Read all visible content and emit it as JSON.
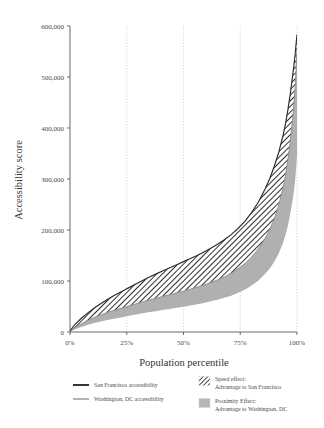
{
  "chart_data": {
    "type": "area",
    "title": "",
    "xlabel": "Population percentile",
    "ylabel": "Accessibility score",
    "xlim": [
      0,
      100
    ],
    "ylim": [
      0,
      600000
    ],
    "grid": true,
    "xticks": [
      0,
      25,
      50,
      75,
      100
    ],
    "xticklabels": [
      "0%",
      "25%",
      "50%",
      "75%",
      "100%"
    ],
    "yticks": [
      0,
      100000,
      200000,
      300000,
      400000,
      500000,
      600000
    ],
    "yticklabels": [
      "0",
      "100,000",
      "200,000",
      "300,000",
      "400,000",
      "500,000",
      "600,000"
    ],
    "x": [
      0,
      2,
      5,
      8,
      11,
      14,
      17,
      20,
      23,
      26,
      29,
      32,
      35,
      38,
      41,
      44,
      47,
      50,
      53,
      56,
      59,
      62,
      65,
      68,
      71,
      74,
      77,
      80,
      83,
      86,
      88,
      90,
      92,
      94,
      95,
      96,
      97,
      98,
      98.6,
      99.2,
      99.6,
      100
    ],
    "series": [
      {
        "name": "San Francisco accessibility",
        "color": "#2b2b2b",
        "values": [
          2000,
          14000,
          27000,
          38000,
          48000,
          57000,
          65000,
          73000,
          80000,
          87000,
          94000,
          101000,
          108000,
          114000,
          120000,
          126000,
          132000,
          138000,
          144000,
          150000,
          157000,
          164000,
          172000,
          181000,
          191000,
          203000,
          217000,
          234000,
          255000,
          281000,
          301000,
          325000,
          353000,
          388000,
          410000,
          436000,
          466000,
          500000,
          521000,
          545000,
          565000,
          583000
        ]
      },
      {
        "name": "Washington, DC accessibility",
        "color": "#8e8e8e",
        "values": [
          1500,
          8000,
          16000,
          23000,
          29000,
          34000,
          39000,
          43000,
          47000,
          51000,
          55000,
          59000,
          63000,
          66000,
          70000,
          73000,
          77000,
          80000,
          84000,
          88000,
          92000,
          97000,
          102000,
          108000,
          115000,
          124000,
          134000,
          147000,
          163000,
          184000,
          201000,
          222000,
          249000,
          285000,
          309000,
          337000,
          372000,
          414000,
          443000,
          481000,
          516000,
          556000
        ]
      }
    ],
    "bands": [
      {
        "name": "Speed effect: Advantage to San Francisco",
        "pattern": "hatch",
        "upper_series": "San Francisco accessibility",
        "lower_series": "Washington, DC accessibility"
      },
      {
        "name": "Proximity Effect: Advantage to Washington, DC",
        "pattern": "solid-gray",
        "color": "#b0b0b0",
        "lower_series": "Washington, DC accessibility",
        "baseline_fraction": 0.62
      }
    ],
    "legend_position": "below-axis",
    "legend_series": [
      {
        "label": "San Francisco accessibility",
        "swatch": "line-dark"
      },
      {
        "label": "Washington, DC accessibility",
        "swatch": "line-gray"
      }
    ],
    "legend_bands": [
      {
        "label_line1": "Speed effect:",
        "label_line2": "Advantage to San Francisco",
        "swatch": "hatch"
      },
      {
        "label_line1": "Proximity Effect:",
        "label_line2": "Advantage to Washington, DC",
        "swatch": "solid-gray"
      }
    ]
  }
}
